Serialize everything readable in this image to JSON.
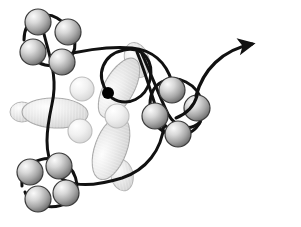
{
  "figure": {
    "background_color": "#ffffff",
    "width": 301,
    "height": 227
  },
  "palette": {
    "stroke_black": "#111111",
    "sphere_light": "#f2f2f2",
    "sphere_mid": "#b8b8b8",
    "sphere_dark": "#6e6e6e",
    "sphere_outline": "#3a3a3a",
    "lobe_light": "#fbfbfb",
    "lobe_mid": "#e2e2e2",
    "lobe_dark": "#c7c7c7",
    "lobe_outline": "#a8a8a8",
    "marker_dot": "#000000"
  },
  "elements": {
    "marker_dot": {
      "name": "active-site-marker",
      "cx": 108,
      "cy": 93,
      "r": 6.0,
      "color": "#000000"
    },
    "arrow": {
      "name": "direction-arrow",
      "path": "M 196,96 C 203,70 222,50 252,44",
      "head_tip_x": 285,
      "head_tip_y": 40,
      "stroke_width": 3.2
    }
  },
  "sphere_clusters": [
    {
      "name": "cluster-top-left",
      "spheres": [
        {
          "cx": 38,
          "cy": 22,
          "r": 13
        },
        {
          "cx": 68,
          "cy": 32,
          "r": 13
        },
        {
          "cx": 33,
          "cy": 52,
          "r": 13
        },
        {
          "cx": 62,
          "cy": 62,
          "r": 13
        }
      ]
    },
    {
      "name": "cluster-bottom-left",
      "spheres": [
        {
          "cx": 30,
          "cy": 172,
          "r": 13
        },
        {
          "cx": 59,
          "cy": 166,
          "r": 13
        },
        {
          "cx": 38,
          "cy": 199,
          "r": 13
        },
        {
          "cx": 66,
          "cy": 193,
          "r": 13
        }
      ]
    },
    {
      "name": "cluster-right",
      "spheres": [
        {
          "cx": 172,
          "cy": 90,
          "r": 13
        },
        {
          "cx": 197,
          "cy": 108,
          "r": 13
        },
        {
          "cx": 155,
          "cy": 116,
          "r": 13
        },
        {
          "cx": 178,
          "cy": 134,
          "r": 13
        }
      ]
    }
  ],
  "central_lobes": [
    {
      "name": "lobe-upper-right",
      "cx": 119,
      "cy": 88,
      "rx": 33,
      "ry": 15,
      "rotation": -61
    },
    {
      "name": "lobe-left",
      "cx": 55,
      "cy": 113,
      "rx": 33,
      "ry": 15,
      "rotation": 2
    },
    {
      "name": "lobe-lower",
      "cx": 111,
      "cy": 148,
      "rx": 33,
      "ry": 16,
      "rotation": -70
    },
    {
      "name": "lobe-top-stub",
      "cx": 137,
      "cy": 60,
      "rx": 12,
      "ry": 18,
      "rotation": -18
    },
    {
      "name": "lobe-bottom-stub",
      "cx": 122,
      "cy": 175,
      "rx": 11,
      "ry": 16,
      "rotation": -12
    },
    {
      "name": "lobe-left-stub",
      "cx": 22,
      "cy": 112,
      "rx": 12,
      "ry": 10,
      "rotation": 0
    }
  ],
  "central_spheres": [
    {
      "name": "core-sphere-upper-left",
      "cx": 82,
      "cy": 89,
      "r": 12
    },
    {
      "name": "core-sphere-right",
      "cx": 117,
      "cy": 116,
      "r": 12
    },
    {
      "name": "core-sphere-lower-left",
      "cx": 80,
      "cy": 131,
      "r": 12
    }
  ],
  "filament": {
    "name": "backbone-filament",
    "stroke_width": 3.0,
    "segments": [
      {
        "name": "filament-top-left-loop",
        "d": "M 24,40 C 24,18 44,10 57,18 C 74,28 80,46 70,58 C 58,72 30,66 27,48"
      },
      {
        "name": "filament-bottom-left-loop",
        "d": "M 22,186 C 20,164 42,155 58,160 C 76,166 82,188 72,199 C 60,212 30,208 25,192"
      },
      {
        "name": "filament-right-loop",
        "d": "M 150,104 C 150,82 170,74 186,82 C 204,91 208,115 196,128 C 183,142 156,135 152,116"
      },
      {
        "name": "filament-main-contour",
        "d": "M 44,34 C 50,58 58,78 52,104 C 46,132 44,152 54,170 C 66,190 96,186 122,178 C 146,170 162,150 164,124"
      },
      {
        "name": "filament-upper-arc",
        "d": "M 60,56 C 84,50 110,46 132,48 C 152,50 166,62 172,82"
      },
      {
        "name": "filament-central-loop",
        "d": "M 108,93 C 94,74 104,54 124,50 C 144,46 154,62 150,80 C 146,98 128,108 112,98"
      },
      {
        "name": "filament-cross-strand-a",
        "d": "M 137,52 C 146,74 152,96 158,114 C 163,128 176,136 190,132"
      },
      {
        "name": "filament-cross-strand-b",
        "d": "M 142,54 C 152,76 160,98 168,114 C 176,128 190,132 200,122"
      },
      {
        "name": "filament-to-arrow",
        "d": "M 176,118 C 186,114 194,106 197,96"
      }
    ]
  }
}
